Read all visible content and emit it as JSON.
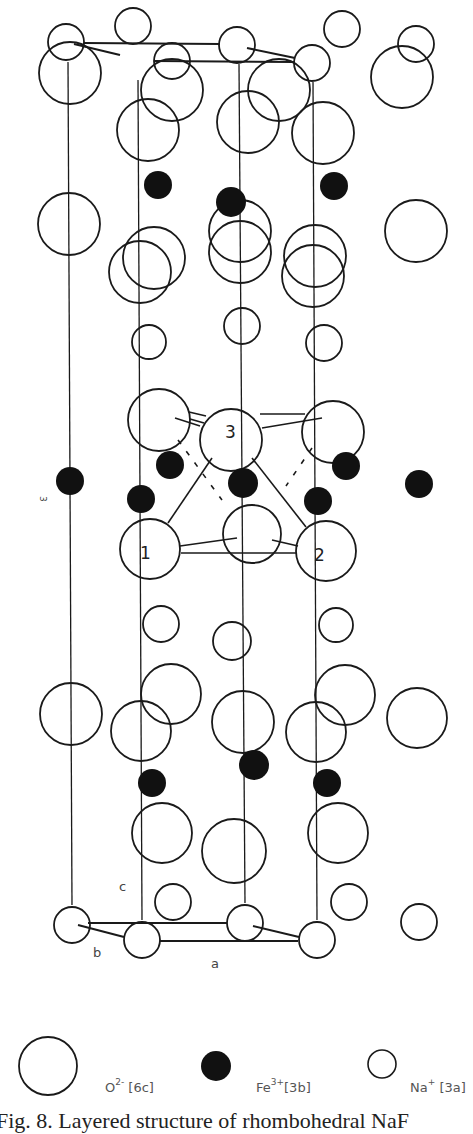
{
  "figure": {
    "caption": "Fig. 8. Layered structure of rhombohedral NaF",
    "axis_labels": {
      "a": "a",
      "b": "b",
      "c": "c",
      "side": "3"
    },
    "atom_numbers": [
      "1",
      "2",
      "3"
    ],
    "legend": [
      {
        "symbol": "large-open-circle",
        "label_base": "O",
        "label_sup": "2-",
        "label_site": " [6c]"
      },
      {
        "symbol": "filled-circle",
        "label_base": "Fe",
        "label_sup": "3+",
        "label_site": "[3b]"
      },
      {
        "symbol": "small-open-circle",
        "label_base": "Na",
        "label_sup": "+",
        "label_site": " [3a]"
      }
    ],
    "colors": {
      "stroke": "#1a1a1a",
      "fill_fe": "#111111",
      "background": "#ffffff"
    }
  },
  "atoms": {
    "O": [
      [
        148,
        130,
        31
      ],
      [
        248,
        122,
        31
      ],
      [
        323,
        133,
        31
      ],
      [
        70,
        73,
        31
      ],
      [
        172,
        90,
        31
      ],
      [
        279,
        90,
        31
      ],
      [
        402,
        77,
        31
      ],
      [
        154,
        258,
        31
      ],
      [
        240,
        252,
        31
      ],
      [
        315,
        256,
        31
      ],
      [
        69,
        224,
        31
      ],
      [
        140,
        272,
        31
      ],
      [
        240,
        231,
        31
      ],
      [
        313,
        276,
        31
      ],
      [
        416,
        231,
        31
      ],
      [
        159,
        420,
        31
      ],
      [
        231,
        440,
        31
      ],
      [
        333,
        432,
        31
      ],
      [
        150,
        549,
        30
      ],
      [
        252,
        534,
        29
      ],
      [
        326,
        551,
        30
      ],
      [
        71,
        714,
        31
      ],
      [
        171,
        694,
        30
      ],
      [
        243,
        722,
        31
      ],
      [
        345,
        695,
        30
      ],
      [
        417,
        718,
        30
      ],
      [
        141,
        731,
        30
      ],
      [
        316,
        732,
        30
      ],
      [
        162,
        833,
        30
      ],
      [
        234,
        851,
        32
      ],
      [
        338,
        833,
        30
      ]
    ],
    "Na": [
      [
        66,
        42,
        18
      ],
      [
        133,
        26,
        18
      ],
      [
        172,
        61,
        18
      ],
      [
        237,
        45,
        18
      ],
      [
        312,
        63,
        18
      ],
      [
        342,
        29,
        18
      ],
      [
        416,
        44,
        18
      ],
      [
        149,
        342,
        17
      ],
      [
        242,
        326,
        18
      ],
      [
        324,
        343,
        18
      ],
      [
        161,
        624,
        18
      ],
      [
        232,
        641,
        19
      ],
      [
        336,
        625,
        17
      ],
      [
        173,
        902,
        18
      ],
      [
        349,
        902,
        18
      ],
      [
        72,
        925,
        18
      ],
      [
        142,
        940,
        18
      ],
      [
        245,
        923,
        18
      ],
      [
        317,
        940,
        18
      ],
      [
        419,
        922,
        18
      ]
    ],
    "Fe": [
      [
        158,
        185,
        14
      ],
      [
        231,
        202,
        15
      ],
      [
        334,
        186,
        14
      ],
      [
        70,
        481,
        14
      ],
      [
        170,
        465,
        14
      ],
      [
        243,
        483,
        15
      ],
      [
        346,
        466,
        14
      ],
      [
        141,
        499,
        14
      ],
      [
        318,
        501,
        14
      ],
      [
        419,
        484,
        14
      ],
      [
        152,
        783,
        14
      ],
      [
        254,
        765,
        15
      ],
      [
        327,
        783,
        14
      ]
    ]
  }
}
